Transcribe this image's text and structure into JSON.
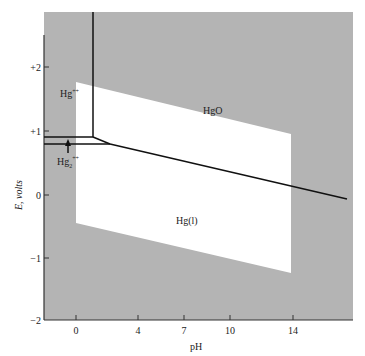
{
  "diagram": {
    "type": "pourbaix",
    "title": "",
    "xlabel": "pH",
    "ylabel": "E, volts",
    "x_ticks": [
      {
        "label": "0",
        "value": 0
      },
      {
        "label": "4",
        "value": 4
      },
      {
        "label": "7",
        "value": 7
      },
      {
        "label": "10",
        "value": 10
      },
      {
        "label": "14",
        "value": 14
      }
    ],
    "y_ticks": [
      {
        "label": "+2",
        "value": 2
      },
      {
        "label": "+1",
        "value": 1
      },
      {
        "label": "0",
        "value": 0
      },
      {
        "label": "−1",
        "value": -1
      },
      {
        "label": "−2",
        "value": -2
      }
    ],
    "regions": [
      {
        "label": "Hg",
        "sup": "++",
        "name": "mercury-ii-ion"
      },
      {
        "label": "HgO",
        "name": "mercury-oxide"
      },
      {
        "label": "Hg",
        "sub": "2",
        "sup": "++",
        "name": "mercurous-ion"
      },
      {
        "label": "Hg(l)",
        "name": "liquid-mercury"
      }
    ],
    "colors": {
      "shaded": "#b4b4b4",
      "water_window": "#ffffff",
      "lines": "#111111"
    }
  }
}
